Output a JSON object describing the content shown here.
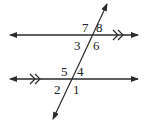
{
  "diagram": {
    "stroke_color": "#2a2a2a",
    "background": "#ffffff",
    "lines": {
      "top_parallel": {
        "y": 35,
        "x1": 9,
        "x2": 138,
        "marker": "double-chevron"
      },
      "bottom_parallel": {
        "y": 79,
        "x1": 9,
        "x2": 138,
        "marker": "double-chevron"
      },
      "transversal": {
        "x1": 107,
        "y1": 4,
        "x2": 53,
        "y2": 119
      }
    },
    "angle_labels": {
      "a1": "1",
      "a2": "2",
      "a3": "3",
      "a4": "4",
      "a5": "5",
      "a6": "6",
      "a7": "7",
      "a8": "8"
    }
  }
}
